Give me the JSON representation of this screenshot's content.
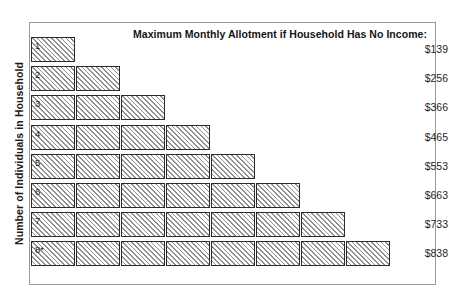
{
  "chart_data": {
    "type": "bar",
    "title": "Maximum Monthly Allotment if Household Has No Income:",
    "xlabel": "",
    "ylabel": "Number of Individuals in Household",
    "categories": [
      "1",
      "2",
      "3",
      "4",
      "5",
      "6",
      "7",
      "8*"
    ],
    "values": [
      139,
      256,
      366,
      465,
      553,
      663,
      733,
      838
    ],
    "value_labels": [
      "$139",
      "$256",
      "$366",
      "$465",
      "$553",
      "$663",
      "$733",
      "$838"
    ],
    "units_per_row": [
      1,
      2,
      3,
      4,
      5,
      6,
      7,
      8
    ],
    "grid": false,
    "legend": "none",
    "orientation": "horizontal"
  },
  "chart": {
    "header_label": "Maximum Monthly Allotment if Household Has No Income:",
    "y_axis_label": "Number of Individuals in Household",
    "rows": [
      {
        "label": "1",
        "boxes": 1,
        "value": "$139"
      },
      {
        "label": "2",
        "boxes": 2,
        "value": "$256"
      },
      {
        "label": "3",
        "boxes": 3,
        "value": "$366"
      },
      {
        "label": "4",
        "boxes": 4,
        "value": "$465"
      },
      {
        "label": "5",
        "boxes": 5,
        "value": "$553"
      },
      {
        "label": "6",
        "boxes": 6,
        "value": "$663"
      },
      {
        "label": "7",
        "boxes": 7,
        "value": "$733"
      },
      {
        "label": "8*",
        "boxes": 8,
        "value": "$838"
      }
    ]
  },
  "style": {
    "box_border_color": "#2b2b2b",
    "hatch_color": "#8f8f8f",
    "frame_color": "#9a9a9a",
    "text_color": "#1a1a1a",
    "background_color": "#ffffff"
  }
}
